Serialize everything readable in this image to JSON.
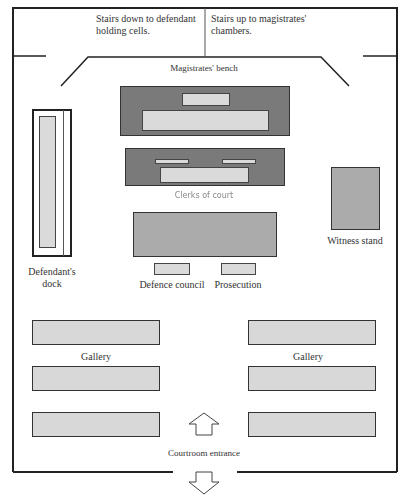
{
  "diagram": {
    "top_area": {
      "stairs_down_label_line1": "Stairs down to defendant",
      "stairs_down_label_line2": "holding cells.",
      "stairs_up_label_line1": "Stairs up  to magistrates'",
      "stairs_up_label_line2": "chambers."
    },
    "labels": {
      "magistrates_bench": "Magistrates' bench",
      "clerks_of_court": "Clerks of court",
      "defendants_dock_line1": "Defendant's",
      "defendants_dock_line2": "dock",
      "witness_stand": "Witness stand",
      "defence_council": "Defence council",
      "prosecution": "Prosecution",
      "gallery_left": "Gallery",
      "gallery_right": "Gallery",
      "courtroom_entrance": "Courtroom entrance"
    },
    "icons": {
      "entrance_up": "arrow-up-outline-icon",
      "entrance_down": "arrow-down-outline-icon"
    },
    "colors": {
      "bench_dark": "#7a7a7a",
      "table_mid": "#ababab",
      "seat_light": "#dadada",
      "lines": "#333333"
    }
  }
}
